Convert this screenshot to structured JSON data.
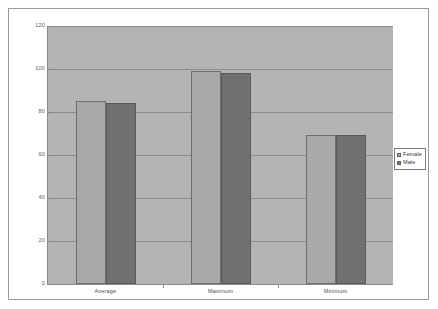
{
  "chart_data": {
    "type": "bar",
    "title": "",
    "subtitle": "",
    "xlabel": "",
    "ylabel": "",
    "categories": [
      "Average",
      "Maximum",
      "Minimum"
    ],
    "series": [
      {
        "name": "Female",
        "color": "#a9a9a9",
        "values": [
          85,
          99,
          69.5
        ]
      },
      {
        "name": "Male",
        "color": "#707070",
        "values": [
          84,
          98,
          69.5
        ]
      }
    ],
    "ylim": [
      0,
      120
    ],
    "ytick_values": [
      0,
      20,
      40,
      60,
      80,
      100,
      120
    ],
    "ytick_labels": [
      "0",
      "20",
      "40",
      "60",
      "80",
      "100",
      "120"
    ],
    "grid": true,
    "grid_axis": "y",
    "legend_position": "right",
    "plot_background": "#b4b4b4",
    "figure_background": "#ffffff",
    "border_color": "#9a9a9a"
  },
  "legend": {
    "entries": [
      {
        "label": "Female"
      },
      {
        "label": "Male"
      }
    ]
  }
}
